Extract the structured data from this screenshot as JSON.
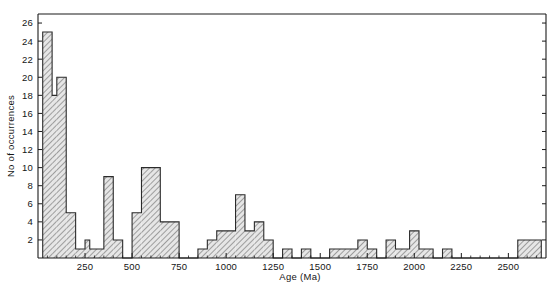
{
  "figure": {
    "background_color": "#ffffff",
    "line_color": "#1a1a1a",
    "bar_fill_color": "#c9c9c9",
    "bar_edge_color": "#2b2b2b",
    "caption_fragment": ""
  },
  "chart_data": {
    "type": "bar",
    "title": "",
    "xlabel": "Age (Ma)",
    "ylabel": "No of occurrences",
    "xlim": [
      0,
      2700
    ],
    "ylim": [
      0,
      27
    ],
    "grid": false,
    "legend": null,
    "bin_width": 25,
    "x_tick_labels": [
      "250",
      "500",
      "750",
      "1000",
      "1250",
      "1500",
      "1750",
      "2000",
      "2250",
      "2500"
    ],
    "x_tick_values": [
      250,
      500,
      750,
      1000,
      1250,
      1500,
      1750,
      2000,
      2250,
      2500
    ],
    "x_minor_tick_interval": 50,
    "y_tick_labels": [
      "2",
      "4",
      "6",
      "8",
      "10",
      "12",
      "14",
      "16",
      "18",
      "20",
      "22",
      "24",
      "26"
    ],
    "y_tick_values": [
      2,
      4,
      6,
      8,
      10,
      12,
      14,
      16,
      18,
      20,
      22,
      24,
      26
    ],
    "bins": [
      {
        "x0": 25,
        "x1": 75,
        "value": 25
      },
      {
        "x0": 75,
        "x1": 100,
        "value": 18
      },
      {
        "x0": 100,
        "x1": 150,
        "value": 20
      },
      {
        "x0": 150,
        "x1": 200,
        "value": 5
      },
      {
        "x0": 200,
        "x1": 250,
        "value": 1
      },
      {
        "x0": 250,
        "x1": 275,
        "value": 2
      },
      {
        "x0": 275,
        "x1": 350,
        "value": 1
      },
      {
        "x0": 350,
        "x1": 400,
        "value": 9
      },
      {
        "x0": 400,
        "x1": 450,
        "value": 2
      },
      {
        "x0": 450,
        "x1": 500,
        "value": 0
      },
      {
        "x0": 500,
        "x1": 550,
        "value": 5
      },
      {
        "x0": 550,
        "x1": 600,
        "value": 10
      },
      {
        "x0": 600,
        "x1": 650,
        "value": 10
      },
      {
        "x0": 650,
        "x1": 750,
        "value": 4
      },
      {
        "x0": 750,
        "x1": 850,
        "value": 0
      },
      {
        "x0": 850,
        "x1": 900,
        "value": 1
      },
      {
        "x0": 900,
        "x1": 950,
        "value": 2
      },
      {
        "x0": 950,
        "x1": 1050,
        "value": 3
      },
      {
        "x0": 1050,
        "x1": 1100,
        "value": 7
      },
      {
        "x0": 1100,
        "x1": 1150,
        "value": 3
      },
      {
        "x0": 1150,
        "x1": 1200,
        "value": 4
      },
      {
        "x0": 1200,
        "x1": 1250,
        "value": 2
      },
      {
        "x0": 1250,
        "x1": 1300,
        "value": 0
      },
      {
        "x0": 1300,
        "x1": 1350,
        "value": 1
      },
      {
        "x0": 1350,
        "x1": 1400,
        "value": 0
      },
      {
        "x0": 1400,
        "x1": 1450,
        "value": 1
      },
      {
        "x0": 1450,
        "x1": 1550,
        "value": 0
      },
      {
        "x0": 1550,
        "x1": 1700,
        "value": 1
      },
      {
        "x0": 1700,
        "x1": 1750,
        "value": 2
      },
      {
        "x0": 1750,
        "x1": 1800,
        "value": 1
      },
      {
        "x0": 1800,
        "x1": 1850,
        "value": 0
      },
      {
        "x0": 1850,
        "x1": 1900,
        "value": 2
      },
      {
        "x0": 1900,
        "x1": 1975,
        "value": 1
      },
      {
        "x0": 1975,
        "x1": 2025,
        "value": 3
      },
      {
        "x0": 2025,
        "x1": 2100,
        "value": 1
      },
      {
        "x0": 2100,
        "x1": 2150,
        "value": 0
      },
      {
        "x0": 2150,
        "x1": 2200,
        "value": 1
      },
      {
        "x0": 2200,
        "x1": 2550,
        "value": 0
      },
      {
        "x0": 2550,
        "x1": 2675,
        "value": 2
      }
    ]
  }
}
